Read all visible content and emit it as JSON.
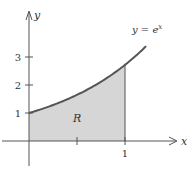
{
  "chart_data": {
    "type": "area",
    "title": "",
    "function": "e^x",
    "curve_label": "y = e^x",
    "curve_label_parts": {
      "lhs": "y = ",
      "base": "e",
      "exp": "x"
    },
    "region_label": "R",
    "shaded_region": {
      "x_from": 0,
      "x_to": 1,
      "under": "y = e^x",
      "above": "x-axis"
    },
    "xlabel": "x",
    "ylabel": "y",
    "x_ticks": [
      0.5,
      1
    ],
    "x_tick_labels": [
      {
        "value": 1,
        "label": "1"
      }
    ],
    "y_ticks": [
      1,
      2,
      3
    ],
    "y_tick_labels": [
      {
        "value": 1,
        "label": "1"
      },
      {
        "value": 2,
        "label": "2"
      },
      {
        "value": 3,
        "label": "3"
      }
    ],
    "xlim": [
      -0.6,
      1.5
    ],
    "ylim": [
      -0.9,
      4.9
    ],
    "curve_domain": [
      0,
      1.22
    ],
    "grid": false,
    "colors": {
      "curve": "#555555",
      "fill": "#d6d6d6",
      "axis": "#555555"
    }
  }
}
